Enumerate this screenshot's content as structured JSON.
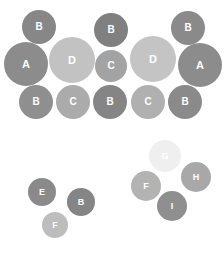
{
  "canvas": {
    "width": 224,
    "height": 254,
    "background": "#ffffff"
  },
  "chart_data": {
    "type": "scatter",
    "title": "",
    "subtitle": "",
    "xlabel": "",
    "ylabel": "",
    "grid": false,
    "legend": "none",
    "axis_visible": false,
    "xlim": [
      0,
      224
    ],
    "ylim": [
      0,
      254
    ],
    "label_color": "#ffffff",
    "clusters": [
      {
        "name": "upper-cluster",
        "points": [
          {
            "label": "A",
            "cx": 26,
            "cy": 64,
            "r": 22,
            "color": "#8c8c8c",
            "font_size": 11
          },
          {
            "label": "A",
            "cx": 200,
            "cy": 65,
            "r": 22,
            "color": "#8c8c8c",
            "font_size": 11
          },
          {
            "label": "B",
            "cx": 39,
            "cy": 27,
            "r": 17,
            "color": "#878787",
            "font_size": 10
          },
          {
            "label": "B",
            "cx": 111,
            "cy": 30,
            "r": 17,
            "color": "#808080",
            "font_size": 10
          },
          {
            "label": "B",
            "cx": 188,
            "cy": 28,
            "r": 17,
            "color": "#8a8a8a",
            "font_size": 10
          },
          {
            "label": "B",
            "cx": 36,
            "cy": 102,
            "r": 17,
            "color": "#8f8f8f",
            "font_size": 10
          },
          {
            "label": "B",
            "cx": 110,
            "cy": 102,
            "r": 17,
            "color": "#858585",
            "font_size": 10
          },
          {
            "label": "B",
            "cx": 185,
            "cy": 102,
            "r": 17,
            "color": "#8a8a8a",
            "font_size": 10
          },
          {
            "label": "C",
            "cx": 111,
            "cy": 66,
            "r": 16,
            "color": "#a3a3a3",
            "font_size": 10
          },
          {
            "label": "C",
            "cx": 73,
            "cy": 102,
            "r": 17,
            "color": "#ababab",
            "font_size": 10
          },
          {
            "label": "C",
            "cx": 148,
            "cy": 102,
            "r": 17,
            "color": "#b0b0b0",
            "font_size": 10
          },
          {
            "label": "D",
            "cx": 72,
            "cy": 60,
            "r": 23,
            "color": "#c2c2c2",
            "font_size": 11
          },
          {
            "label": "D",
            "cx": 153,
            "cy": 59,
            "r": 23,
            "color": "#c4c4c4",
            "font_size": 11
          }
        ]
      },
      {
        "name": "lower-left-cluster",
        "points": [
          {
            "label": "E",
            "cx": 42,
            "cy": 192,
            "r": 14,
            "color": "#8a8a8a",
            "font_size": 9
          },
          {
            "label": "B",
            "cx": 81,
            "cy": 202,
            "r": 14,
            "color": "#858585",
            "font_size": 9
          },
          {
            "label": "F",
            "cx": 55,
            "cy": 225,
            "r": 13,
            "color": "#bdbdbd",
            "font_size": 9
          }
        ]
      },
      {
        "name": "lower-right-cluster",
        "points": [
          {
            "label": "G",
            "cx": 165,
            "cy": 156,
            "r": 16,
            "color": "#efefef",
            "font_size": 9
          },
          {
            "label": "F",
            "cx": 146,
            "cy": 186,
            "r": 15,
            "color": "#b3b3b3",
            "font_size": 9
          },
          {
            "label": "H",
            "cx": 196,
            "cy": 177,
            "r": 15,
            "color": "#a8a8a8",
            "font_size": 9
          },
          {
            "label": "I",
            "cx": 172,
            "cy": 206,
            "r": 15,
            "color": "#8f8f8f",
            "font_size": 9
          }
        ]
      }
    ]
  }
}
